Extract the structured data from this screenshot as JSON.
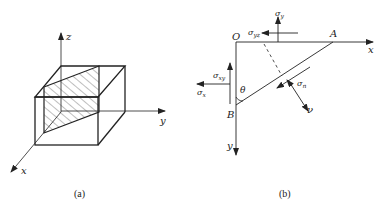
{
  "figure_a": {
    "caption": "(a)",
    "axes": {
      "x": "x",
      "y": "y",
      "z": "z"
    }
  },
  "figure_b": {
    "caption": "(b)",
    "points": {
      "origin": "O",
      "A": "A",
      "B": "B"
    },
    "axes": {
      "x": "x",
      "y": "y"
    },
    "angle": "θ",
    "stresses": {
      "sigma_y": "σ",
      "sigma_y_sub": "y",
      "sigma_yz": "σ",
      "sigma_yz_sub": "yz",
      "sigma_xy": "σ",
      "sigma_xy_sub": "xy",
      "sigma_x": "σ",
      "sigma_x_sub": "x",
      "sigma_n": "σ",
      "sigma_n_sub": "n"
    },
    "normal": "ν"
  },
  "colors": {
    "line": "#222222",
    "background": "#ffffff"
  }
}
